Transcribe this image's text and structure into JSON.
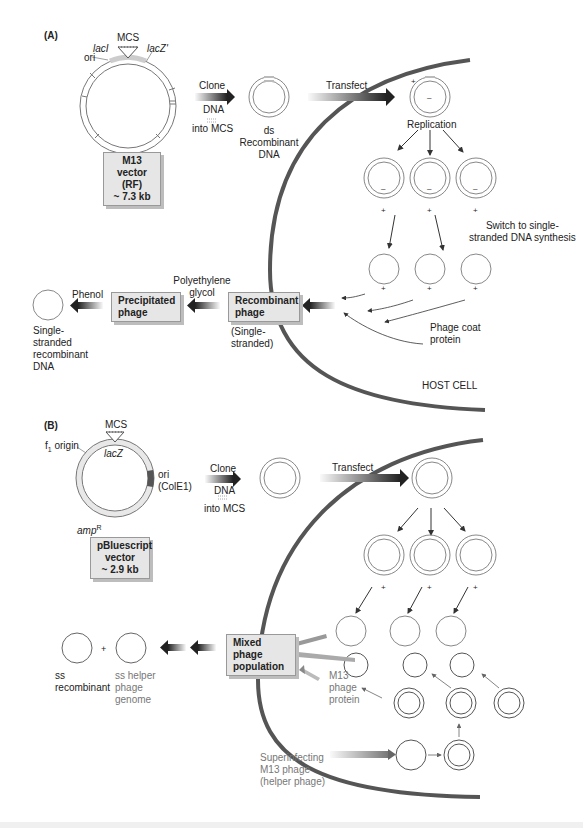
{
  "panel_a": {
    "label": "(A)",
    "vector": {
      "mcs": "MCS",
      "lacI": "lacI",
      "lacZ": "lacZ'",
      "ori": "ori",
      "box_line1": "M13 vector",
      "box_line2": "(RF)",
      "box_line3": "~ 7.3 kb"
    },
    "clone_arrow": {
      "top": "Clone",
      "mid": "DNA",
      "bottom": "into MCS"
    },
    "ds_label": {
      "line1": "ds",
      "line2": "Recombinant",
      "line3": "DNA"
    },
    "transfect": "Transfect",
    "replication": "Replication",
    "switch_label": {
      "line1": "Switch to single-",
      "line2": "stranded DNA synthesis"
    },
    "plus": "+",
    "minus": "–",
    "coat_label": {
      "line1": "Phage coat",
      "line2": "protein"
    },
    "host_cell": "HOST CELL",
    "recombinant_box": {
      "line1": "Recombinant",
      "line2": "phage"
    },
    "single_stranded": {
      "line1": "(Single-",
      "line2": "stranded)"
    },
    "peg": {
      "line1": "Polyethylene",
      "line2": "glycol"
    },
    "precipitated_box": {
      "line1": "Precipitated",
      "line2": "phage"
    },
    "phenol": "Phenol",
    "ss_dna": {
      "line1": "Single-",
      "line2": "stranded",
      "line3": "recombinant",
      "line4": "DNA"
    }
  },
  "panel_b": {
    "label": "(B)",
    "vector": {
      "mcs": "MCS",
      "f1": "f",
      "f1_sub": "1",
      "f1_rest": " origin",
      "lacZ": "lacZ",
      "ori_line1": "ori",
      "ori_line2": "(ColE1)",
      "amp": "amp",
      "amp_sup": "R",
      "box_line1": "pBluescript",
      "box_line2": "vector",
      "box_line3": "~ 2.9 kb"
    },
    "clone_arrow": {
      "top": "Clone",
      "mid": "DNA",
      "bottom": "into MCS"
    },
    "transfect": "Transfect",
    "mixed_box": {
      "line1": "Mixed phage",
      "line2": "population"
    },
    "ss_recombinant": {
      "line1": "ss",
      "line2": "recombinant"
    },
    "plus": "+",
    "helper_genome": {
      "line1": "ss helper",
      "line2": "phage",
      "line3": "genome"
    },
    "m13_protein": {
      "line1": "M13",
      "line2": "phage",
      "line3": "protein"
    },
    "superinfecting": {
      "line1": "Superinfecting",
      "line2": "M13 phage",
      "line3": "(helper phage)"
    }
  },
  "colors": {
    "cell_membrane": "#555555",
    "box_fill": "#e6e6e6",
    "box_shadow": "#bdbdbd",
    "circle_stroke": "#666666",
    "vector_ring_fill": "#e8e8e8",
    "ori_colE1": "#555555"
  }
}
